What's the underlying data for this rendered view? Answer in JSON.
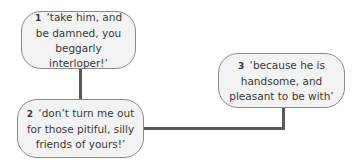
{
  "nodes": [
    {
      "number": "1",
      "quote": "‘take him, and be damned, you beggarly interloper!’"
    },
    {
      "number": "2",
      "quote": "‘don’t turn me out for those pitiful, silly friends of yours!’"
    },
    {
      "number": "3",
      "quote": "‘because he is handsome, and pleasant to be with’"
    }
  ],
  "colors": {
    "node_fill": "#f3f3f3",
    "node_border": "#8a8a8a",
    "connector": "#5a5a5a",
    "text": "#3a3a3a"
  }
}
